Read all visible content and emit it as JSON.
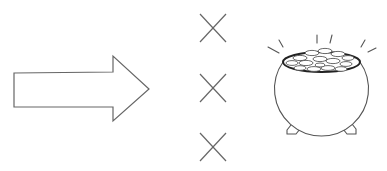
{
  "diagram": {
    "description": "Arrow pointing right toward three X marks and a pot of gold",
    "elements": {
      "arrow": {
        "label": "right-arrow",
        "direction": "right"
      },
      "x_marks": [
        {
          "label": "x-mark-1"
        },
        {
          "label": "x-mark-2"
        },
        {
          "label": "x-mark-3"
        }
      ],
      "pot": {
        "label": "pot-of-gold"
      }
    },
    "colors": {
      "stroke": "#555555",
      "background": "#ffffff",
      "coin_fill": "#ffffff",
      "rim": "#222222"
    }
  }
}
